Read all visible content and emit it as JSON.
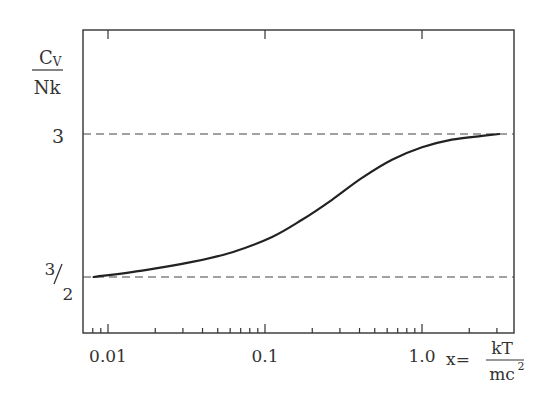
{
  "chart_data": {
    "type": "line",
    "title": "",
    "xlabel": "x = kT / mc^2",
    "xlabel_parts": {
      "prefix": "x=",
      "numerator": "kT",
      "denominator": "mc",
      "superscript": "2"
    },
    "ylabel": "C_V / Nk",
    "ylabel_parts": {
      "numerator": "C",
      "numerator_sub": "V",
      "denominator": "Nk"
    },
    "xscale": "log",
    "xlim": [
      0.007,
      4.0
    ],
    "ylim": [
      1.0,
      3.5
    ],
    "x_tick_labels": [
      "0.01",
      "0.1",
      "1.0"
    ],
    "x_tick_values": [
      0.01,
      0.1,
      1.0
    ],
    "y_tick_labels": [
      "3",
      "3/2"
    ],
    "y_tick_values": [
      3,
      1.5
    ],
    "y_tick_fraction": {
      "numerator": "3",
      "denominator": "2"
    },
    "reference_lines": [
      {
        "y": 3.0,
        "style": "dashed",
        "label": "3"
      },
      {
        "y": 1.5,
        "style": "dashed",
        "label": "3/2"
      }
    ],
    "grid": false,
    "legend": null,
    "series": [
      {
        "name": "C_V/Nk",
        "x": [
          0.0081,
          0.0169,
          0.035,
          0.062,
          0.111,
          0.172,
          0.267,
          0.415,
          0.644,
          1.0,
          1.55,
          2.41,
          3.1
        ],
        "y": [
          1.5,
          1.57,
          1.66,
          1.76,
          1.92,
          2.1,
          2.31,
          2.54,
          2.73,
          2.86,
          2.94,
          2.98,
          3.0
        ]
      }
    ]
  },
  "axes": {
    "x_major_ticks": [
      "0.01",
      "0.1",
      "1.0"
    ],
    "y_labels": {
      "three": "3",
      "half_num": "3",
      "half_den": "2"
    }
  },
  "colors": {
    "axis": "#333333",
    "curve": "#222222",
    "dashed": "#444444",
    "background": "#ffffff"
  }
}
